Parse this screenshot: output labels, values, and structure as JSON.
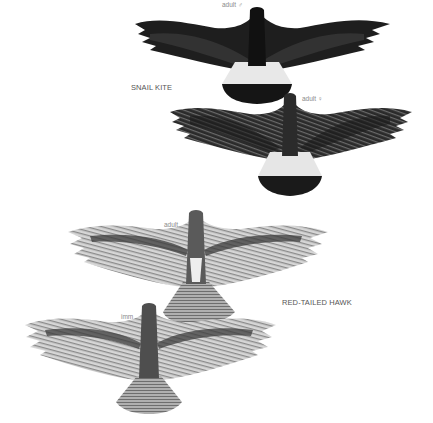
{
  "plate": {
    "species": [
      {
        "name": "SNAIL KITE",
        "birds": [
          {
            "label": "adult ♂",
            "plumage": "dark",
            "colors": {
              "body": "#1e1e1e",
              "tail_base": "#e8e8e8",
              "tail_band": "#151515"
            }
          },
          {
            "label": "adult ♀",
            "plumage": "streaked-dark",
            "colors": {
              "body": "#2a2a2a",
              "tail_base": "#e6e6e6",
              "tail_band": "#1a1a1a"
            }
          }
        ]
      },
      {
        "name": "RED-TAILED HAWK",
        "birds": [
          {
            "label": "adult",
            "plumage": "pale-barred",
            "colors": {
              "wing": "#bdbdbd",
              "tail": "#9a9a9a",
              "patagial": "#3a3a3a"
            }
          },
          {
            "label": "imm",
            "plumage": "pale-barred",
            "colors": {
              "wing": "#c4c4c4",
              "tail": "#a5a5a5",
              "patagial": "#3c3c3c"
            }
          }
        ]
      }
    ]
  }
}
